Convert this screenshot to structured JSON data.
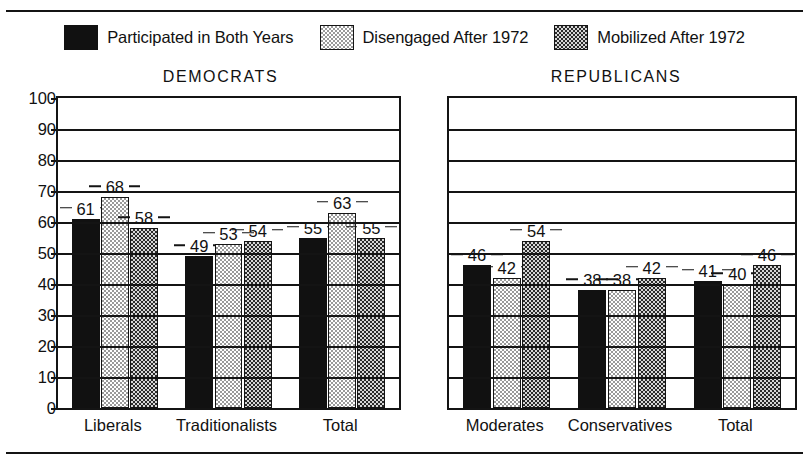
{
  "legend": {
    "items": [
      {
        "label": "Participated in Both Years",
        "pattern": "solid-black",
        "swatch_name": "legend-swatch-participated"
      },
      {
        "label": "Disengaged After 1972",
        "pattern": "light-checker",
        "swatch_name": "legend-swatch-disengaged"
      },
      {
        "label": "Mobilized After 1972",
        "pattern": "dark-checker",
        "swatch_name": "legend-swatch-mobilized"
      }
    ]
  },
  "yaxis": {
    "ticks": [
      "100",
      "90",
      "80",
      "70",
      "60",
      "50",
      "40",
      "30",
      "20",
      "10",
      "0"
    ]
  },
  "panels": [
    {
      "title": "DEMOCRATS",
      "categories": [
        "Liberals",
        "Traditionalists",
        "Total"
      ]
    },
    {
      "title": "REPUBLICANS",
      "categories": [
        "Moderates",
        "Conservatives",
        "Total"
      ]
    }
  ],
  "chart_data": {
    "type": "bar",
    "title": "",
    "xlabel": "",
    "ylabel": "",
    "ylim": [
      0,
      100
    ],
    "ytick_step": 10,
    "grid": true,
    "legend_position": "top",
    "value_labels": true,
    "panels": [
      {
        "name": "DEMOCRATS",
        "categories": [
          "Liberals",
          "Traditionalists",
          "Total"
        ],
        "series": [
          {
            "name": "Participated in Both Years",
            "values": [
              61,
              49,
              55
            ]
          },
          {
            "name": "Disengaged After 1972",
            "values": [
              68,
              53,
              63
            ]
          },
          {
            "name": "Mobilized After 1972",
            "values": [
              58,
              54,
              55
            ]
          }
        ]
      },
      {
        "name": "REPUBLICANS",
        "categories": [
          "Moderates",
          "Conservatives",
          "Total"
        ],
        "series": [
          {
            "name": "Participated in Both Years",
            "values": [
              46,
              38,
              41
            ]
          },
          {
            "name": "Disengaged After 1972",
            "values": [
              42,
              38,
              40
            ]
          },
          {
            "name": "Mobilized After 1972",
            "values": [
              54,
              42,
              46
            ]
          }
        ]
      }
    ]
  },
  "colors": {
    "ink": "#141414",
    "background": "#ffffff",
    "solid_bar": "#111111",
    "light_checker": "#9a9a9a",
    "dark_checker": "#2a2a2a"
  }
}
